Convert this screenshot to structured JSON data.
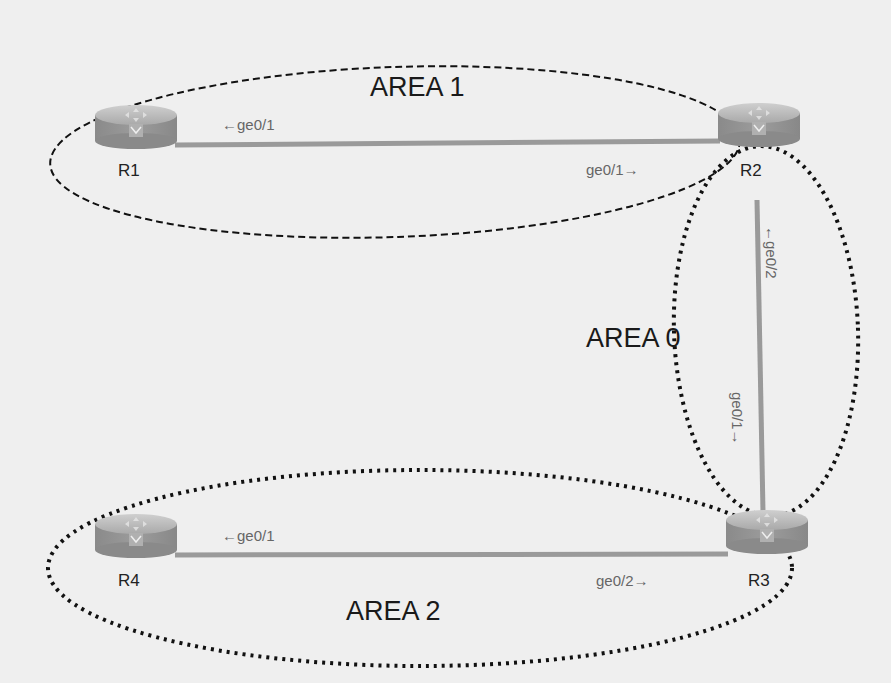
{
  "diagram": {
    "areas": [
      {
        "id": "area1",
        "label": "AREA 1",
        "border": "dashed"
      },
      {
        "id": "area0",
        "label": "AREA 0",
        "border": "dotted"
      },
      {
        "id": "area2",
        "label": "AREA 2",
        "border": "dotted"
      }
    ],
    "routers": [
      {
        "id": "R1",
        "label": "R1"
      },
      {
        "id": "R2",
        "label": "R2"
      },
      {
        "id": "R3",
        "label": "R3"
      },
      {
        "id": "R4",
        "label": "R4"
      }
    ],
    "links": [
      {
        "from": "R1",
        "to": "R2",
        "from_if": "←ge0/1",
        "to_if": "ge0/1→"
      },
      {
        "from": "R2",
        "to": "R3",
        "from_if": "←ge0/2",
        "to_if": "ge0/1→"
      },
      {
        "from": "R4",
        "to": "R3",
        "from_if": "←ge0/1",
        "to_if": "ge0/2→"
      }
    ],
    "colors": {
      "background": "#efefef",
      "link": "#9a9a9a",
      "router_body": "#8e8e8e",
      "router_top": "#b5b5b5",
      "area_border": "#111111"
    }
  }
}
